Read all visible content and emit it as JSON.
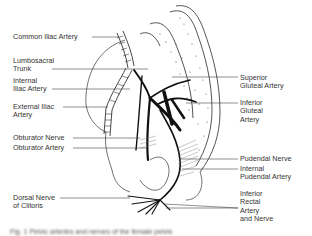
{
  "figure": {
    "title": "Pelvic arteries and nerves",
    "colors": {
      "ink": "#1a1a1a",
      "label": "#333333",
      "background": "#ffffff",
      "shade": "#9a9a9a"
    },
    "labels_left": [
      {
        "id": "common-iliac-artery",
        "lines": [
          "Common Iliac Artery"
        ]
      },
      {
        "id": "lumbosacral-trunk",
        "lines": [
          "Lumbosacral",
          "Trunk"
        ]
      },
      {
        "id": "internal-iliac-artery",
        "lines": [
          "Internal",
          "Iliac Artery"
        ]
      },
      {
        "id": "external-iliac-artery",
        "lines": [
          "External Iliac",
          "Artery"
        ]
      },
      {
        "id": "obturator-nerve",
        "lines": [
          "Obturator Nerve"
        ]
      },
      {
        "id": "obturator-artery",
        "lines": [
          "Obturator Artery"
        ]
      },
      {
        "id": "dorsal-nerve-of-clitoris",
        "lines": [
          "Dorsal Nerve",
          "of Clitoris"
        ]
      }
    ],
    "labels_right": [
      {
        "id": "superior-gluteal-artery",
        "lines": [
          "Superior",
          "Gluteal Artery"
        ]
      },
      {
        "id": "inferior-gluteal-artery",
        "lines": [
          "Inferior",
          "Gluteal",
          "Artery"
        ]
      },
      {
        "id": "pudendal-nerve",
        "lines": [
          "Pudendal Nerve"
        ]
      },
      {
        "id": "internal-pudendal-artery",
        "lines": [
          "Internal",
          "Pudendal Artery"
        ]
      },
      {
        "id": "inferior-rectal-artery-and-nerve",
        "lines": [
          "Inferior",
          "Rectal",
          "Artery",
          "and Nerve"
        ]
      }
    ],
    "caption": "Fig. 1  Pelvic arteries and nerves of the female pelvis"
  }
}
